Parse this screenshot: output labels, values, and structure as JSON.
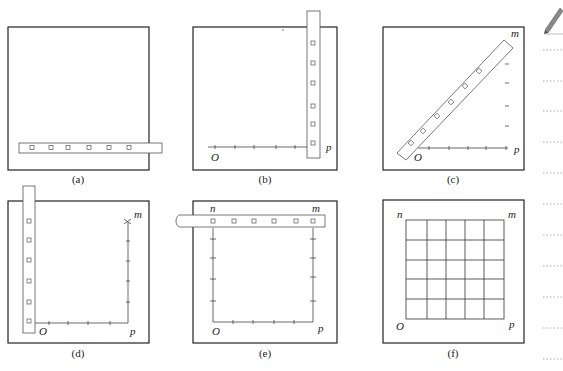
{
  "panels": [
    {
      "id": "a",
      "caption": "(a)"
    },
    {
      "id": "b",
      "caption": "(b)",
      "labels": {
        "origin": "O",
        "p": "p"
      }
    },
    {
      "id": "c",
      "caption": "(c)",
      "labels": {
        "origin": "O",
        "p": "p",
        "m": "m"
      }
    },
    {
      "id": "d",
      "caption": "(d)",
      "labels": {
        "origin": "O",
        "p": "p",
        "m": "m"
      }
    },
    {
      "id": "e",
      "caption": "(e)",
      "labels": {
        "origin": "O",
        "p": "p",
        "m": "m",
        "n": "n"
      }
    },
    {
      "id": "f",
      "caption": "(f)",
      "labels": {
        "origin": "O",
        "p": "p",
        "m": "m",
        "n": "n"
      },
      "grid": {
        "rows": 5,
        "cols": 5
      }
    }
  ],
  "sidebar": {
    "icon": "pencil-icon",
    "note_lines": 11
  },
  "colors": {
    "stroke": "#222222",
    "ruler": "#555555",
    "dots": "#888888"
  }
}
